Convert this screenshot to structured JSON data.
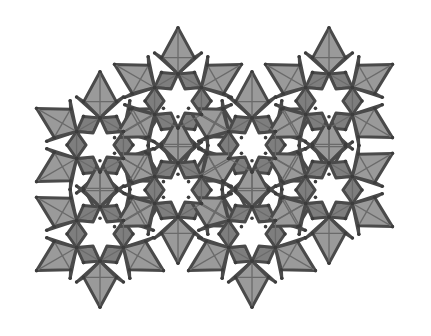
{
  "figure": {
    "type": "geometric-tiling",
    "width": 431,
    "height": 336,
    "edge_length": 33,
    "colors": {
      "background": "#ffffff",
      "square_dark": "#7e7e7e",
      "square_mid": "#9a9a9a",
      "triangle": "#ffffff",
      "star": "#ffffff",
      "edge": "#4a4a4a",
      "thin_line": "#6a6a6a"
    },
    "star_centers": [
      [
        100,
        145
      ],
      [
        178,
        101
      ],
      [
        252,
        145
      ],
      [
        329,
        101
      ],
      [
        100,
        234
      ],
      [
        178,
        190
      ],
      [
        252,
        234
      ],
      [
        329,
        190
      ]
    ]
  }
}
